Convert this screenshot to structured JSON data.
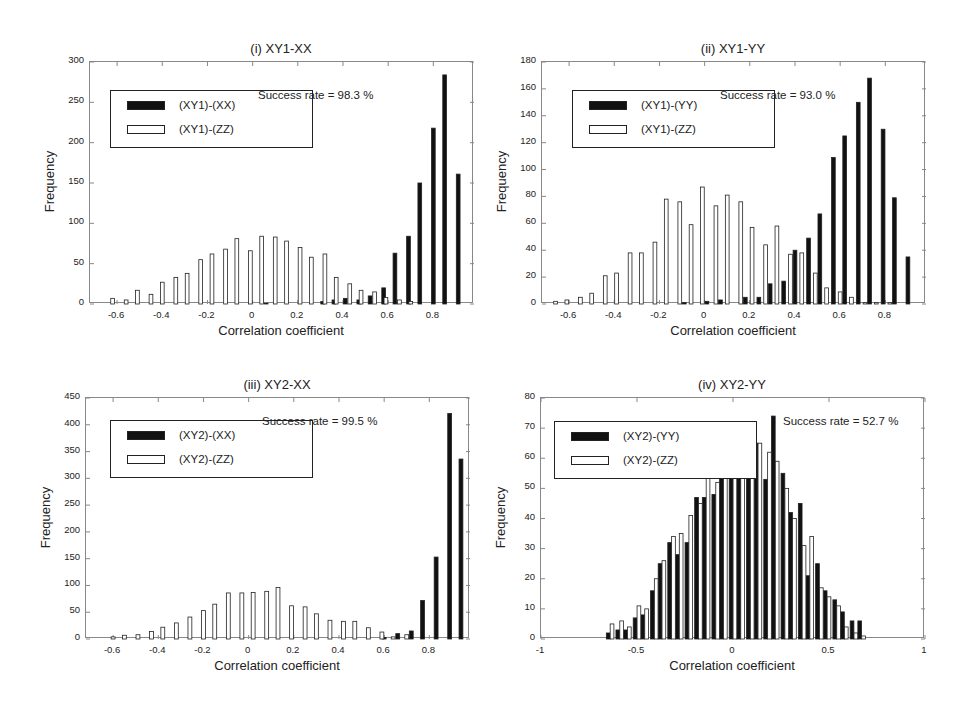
{
  "chart_data": [
    {
      "id": "i",
      "type": "bar",
      "title": "(i) XY1-XX",
      "xlabel": "Correlation coefficient",
      "ylabel": "Frequency",
      "xlim": [
        -0.72,
        0.98
      ],
      "ylim": [
        0,
        300
      ],
      "yticks": [
        0,
        50,
        100,
        150,
        200,
        250,
        300
      ],
      "xticks": [
        -0.6,
        -0.4,
        -0.2,
        0,
        0.2,
        0.4,
        0.6,
        0.8
      ],
      "xtick_labels": [
        "-0.6",
        "-0.4",
        "-0.2",
        "0",
        "0.2",
        "0.4",
        "0.6",
        "0.8"
      ],
      "annotation": "Success rate = 98.3 %",
      "legend": [
        "(XY1)-(XX)",
        "(XY1)-(ZZ)"
      ],
      "bin_width": 0.055,
      "series": [
        {
          "name": "(XY1)-(XX)",
          "fill": "#111111",
          "x": [
            0.06,
            0.31,
            0.36,
            0.41,
            0.47,
            0.52,
            0.58,
            0.63,
            0.69,
            0.74,
            0.8,
            0.85,
            0.91
          ],
          "values": [
            1,
            3,
            5,
            7,
            5,
            10,
            20,
            63,
            84,
            150,
            218,
            284,
            161
          ]
        },
        {
          "name": "(XY1)-(ZZ)",
          "fill": "#ffffff",
          "x": [
            -0.62,
            -0.56,
            -0.51,
            -0.45,
            -0.4,
            -0.34,
            -0.29,
            -0.23,
            -0.18,
            -0.12,
            -0.07,
            -0.01,
            0.04,
            0.1,
            0.15,
            0.21,
            0.26,
            0.32,
            0.37,
            0.43,
            0.48,
            0.54,
            0.59,
            0.65,
            0.7
          ],
          "values": [
            7,
            5,
            17,
            12,
            27,
            33,
            38,
            55,
            62,
            68,
            81,
            66,
            84,
            83,
            78,
            70,
            58,
            62,
            33,
            25,
            17,
            15,
            8,
            5,
            3
          ]
        }
      ]
    },
    {
      "id": "ii",
      "type": "bar",
      "title": "(ii) XY1-YY",
      "xlabel": "Correlation coefficient",
      "ylabel": "Frequency",
      "xlim": [
        -0.72,
        0.98
      ],
      "ylim": [
        0,
        180
      ],
      "yticks": [
        0,
        20,
        40,
        60,
        80,
        100,
        120,
        140,
        160,
        180
      ],
      "xticks": [
        -0.6,
        -0.4,
        -0.2,
        0,
        0.2,
        0.4,
        0.6,
        0.8
      ],
      "xtick_labels": [
        "-0.6",
        "-0.4",
        "-0.2",
        "0",
        "0.2",
        "0.4",
        "0.6",
        "0.8"
      ],
      "annotation": "Success rate = 93.0 %",
      "legend": [
        "(XY1)-(YY)",
        "(XY1)-(ZZ)"
      ],
      "bin_width": 0.055,
      "series": [
        {
          "name": "(XY1)-(YY)",
          "fill": "#111111",
          "x": [
            -0.09,
            0.01,
            0.07,
            0.18,
            0.24,
            0.29,
            0.35,
            0.4,
            0.46,
            0.51,
            0.57,
            0.62,
            0.68,
            0.73,
            0.79,
            0.84,
            0.9
          ],
          "values": [
            1,
            2,
            3,
            5,
            5,
            15,
            17,
            40,
            49,
            67,
            109,
            125,
            150,
            168,
            130,
            79,
            35
          ]
        },
        {
          "name": "(XY1)-(ZZ)",
          "fill": "#ffffff",
          "x": [
            -0.66,
            -0.61,
            -0.55,
            -0.5,
            -0.44,
            -0.39,
            -0.33,
            -0.28,
            -0.22,
            -0.17,
            -0.11,
            -0.06,
            -0.01,
            0.05,
            0.1,
            0.16,
            0.21,
            0.27,
            0.32,
            0.38,
            0.43,
            0.49,
            0.54,
            0.6,
            0.65,
            0.71,
            0.76,
            0.82
          ],
          "values": [
            2,
            3,
            5,
            8,
            21,
            23,
            38,
            38,
            46,
            78,
            76,
            59,
            87,
            73,
            81,
            76,
            57,
            44,
            58,
            37,
            38,
            23,
            12,
            9,
            5,
            1,
            1,
            1
          ]
        }
      ]
    },
    {
      "id": "iii",
      "type": "bar",
      "title": "(iii) XY2-XX",
      "xlabel": "Correlation coefficient",
      "ylabel": "Frequency",
      "xlim": [
        -0.72,
        0.98
      ],
      "ylim": [
        0,
        450
      ],
      "yticks": [
        0,
        50,
        100,
        150,
        200,
        250,
        300,
        350,
        400,
        450
      ],
      "xticks": [
        -0.6,
        -0.4,
        -0.2,
        0,
        0.2,
        0.4,
        0.6,
        0.8
      ],
      "xtick_labels": [
        "-0.6",
        "-0.4",
        "-0.2",
        "0",
        "0.2",
        "0.4",
        "0.6",
        "0.8"
      ],
      "annotation": "Success rate = 99.5 %",
      "legend": [
        "(XY2)-(XX)",
        "(XY2)-(ZZ)"
      ],
      "bin_width": 0.057,
      "series": [
        {
          "name": "(XY2)-(XX)",
          "fill": "#111111",
          "x": [
            0.6,
            0.66,
            0.72,
            0.77,
            0.83,
            0.89,
            0.94
          ],
          "values": [
            3,
            10,
            15,
            72,
            153,
            421,
            336
          ]
        },
        {
          "name": "(XY2)-(ZZ)",
          "fill": "#ffffff",
          "x": [
            -0.6,
            -0.55,
            -0.49,
            -0.43,
            -0.38,
            -0.32,
            -0.26,
            -0.2,
            -0.15,
            -0.09,
            -0.03,
            0.02,
            0.08,
            0.13,
            0.19,
            0.25,
            0.3,
            0.36,
            0.42,
            0.47,
            0.53,
            0.59,
            0.64,
            0.7
          ],
          "values": [
            4,
            7,
            8,
            14,
            22,
            30,
            41,
            53,
            65,
            86,
            86,
            87,
            89,
            96,
            62,
            60,
            47,
            35,
            33,
            33,
            21,
            13,
            4,
            8
          ]
        }
      ]
    },
    {
      "id": "iv",
      "type": "bar",
      "title": "(iv) XY2-YY",
      "xlabel": "Correlation coefficient",
      "ylabel": "Frequency",
      "xlim": [
        -1,
        1
      ],
      "ylim": [
        0,
        80
      ],
      "yticks": [
        0,
        10,
        20,
        30,
        40,
        50,
        60,
        70,
        80
      ],
      "xticks": [
        -1,
        -0.5,
        0,
        0.5,
        1
      ],
      "xtick_labels": [
        "-1",
        "-0.5",
        "0",
        "0.5",
        "1"
      ],
      "annotation": "Success rate = 52.7 %",
      "legend": [
        "(XY2)-(YY)",
        "(XY2)-(ZZ)"
      ],
      "bin_width": 0.046,
      "series": [
        {
          "name": "(XY2)-(YY)",
          "fill": "#111111",
          "x": [
            -0.65,
            -0.6,
            -0.56,
            -0.51,
            -0.47,
            -0.42,
            -0.38,
            -0.33,
            -0.29,
            -0.24,
            -0.19,
            -0.15,
            -0.1,
            -0.06,
            -0.01,
            0.03,
            0.08,
            0.12,
            0.17,
            0.21,
            0.26,
            0.3,
            0.35,
            0.39,
            0.44,
            0.48,
            0.53,
            0.57,
            0.62,
            0.66
          ],
          "values": [
            2,
            3,
            3,
            7,
            8,
            16,
            25,
            32,
            28,
            32,
            47,
            47,
            48,
            63,
            68,
            70,
            71,
            65,
            53,
            74,
            55,
            42,
            45,
            21,
            25,
            16,
            13,
            9,
            6,
            6
          ]
        },
        {
          "name": "(XY2)-(ZZ)",
          "fill": "#ffffff",
          "x": [
            -0.63,
            -0.58,
            -0.54,
            -0.49,
            -0.45,
            -0.4,
            -0.36,
            -0.31,
            -0.27,
            -0.22,
            -0.17,
            -0.13,
            -0.08,
            -0.04,
            0.01,
            0.05,
            0.1,
            0.14,
            0.19,
            0.23,
            0.28,
            0.32,
            0.37,
            0.41,
            0.46,
            0.5,
            0.55,
            0.59,
            0.64,
            0.68
          ],
          "values": [
            5,
            6,
            4,
            11,
            10,
            20,
            26,
            34,
            35,
            41,
            45,
            62,
            52,
            69,
            64,
            62,
            64,
            65,
            62,
            59,
            50,
            40,
            31,
            34,
            17,
            14,
            11,
            4,
            2,
            1
          ]
        }
      ]
    }
  ],
  "panels": [
    {
      "title": "(i) XY1-XX",
      "success": "Success rate = 98.3 %",
      "legend1": "(XY1)-(XX)",
      "legend2": "(XY1)-(ZZ)",
      "ylabel": "Frequency",
      "xlabel": "Correlation coefficient"
    },
    {
      "title": "(ii) XY1-YY",
      "success": "Success rate = 93.0 %",
      "legend1": "(XY1)-(YY)",
      "legend2": "(XY1)-(ZZ)",
      "ylabel": "Frequency",
      "xlabel": "Correlation coefficient"
    },
    {
      "title": "(iii) XY2-XX",
      "success": "Success rate = 99.5 %",
      "legend1": "(XY2)-(XX)",
      "legend2": "(XY2)-(ZZ)",
      "ylabel": "Frequency",
      "xlabel": "Correlation coefficient"
    },
    {
      "title": "(iv) XY2-YY",
      "success": "Success rate = 52.7 %",
      "legend1": "(XY2)-(YY)",
      "legend2": "(XY2)-(ZZ)",
      "ylabel": "Frequency",
      "xlabel": "Correlation coefficient"
    }
  ],
  "colors": {
    "series_dark": "#111111",
    "series_light": "#ffffff",
    "axis": "#888888",
    "text": "#222222"
  }
}
